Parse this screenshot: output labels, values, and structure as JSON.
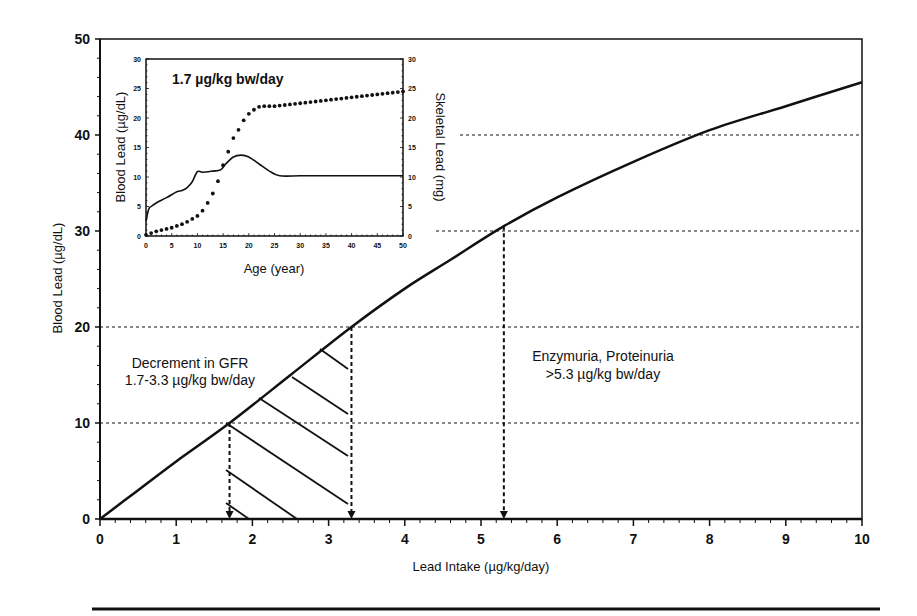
{
  "chart_data": [
    {
      "id": "main",
      "type": "line",
      "title": "",
      "xlabel": "Lead Intake (µg/kg/day)",
      "ylabel": "Blood Lead (µg/dL)",
      "xlim": [
        0,
        10
      ],
      "ylim": [
        0,
        50
      ],
      "xticks": [
        "0",
        "1",
        "2",
        "3",
        "4",
        "5",
        "6",
        "7",
        "8",
        "9",
        "10"
      ],
      "yticks": [
        "0",
        "10",
        "20",
        "30",
        "40",
        "50"
      ],
      "grid": "dashed horizontal reference lines at 10, 20, 30, 40",
      "series": [
        {
          "name": "Blood lead vs lead intake",
          "x": [
            0,
            0.5,
            1,
            1.7,
            2.5,
            3.3,
            4,
            4.6,
            5.3,
            6,
            7,
            8,
            9,
            10
          ],
          "y": [
            0,
            3,
            6,
            10,
            15,
            20,
            24,
            27,
            30.5,
            33.5,
            37.2,
            40.5,
            43,
            45.5
          ]
        }
      ],
      "reference_lines": [
        {
          "type": "vertical-arrow",
          "x": 1.7,
          "from_y": 10,
          "to_y": 0
        },
        {
          "type": "vertical-arrow",
          "x": 3.3,
          "from_y": 20,
          "to_y": 0
        },
        {
          "type": "vertical-arrow",
          "x": 5.3,
          "from_y": 30.5,
          "to_y": 0
        }
      ],
      "hatched_region": {
        "x_range": [
          1.7,
          3.3
        ],
        "description": "Decrement in GFR range"
      },
      "annotations": [
        {
          "lines": [
            "Decrement in GFR",
            "1.7-3.3 µg/kg bw/day"
          ],
          "x": 1.3,
          "y": 16
        },
        {
          "lines": [
            "Enzymuria, Proteinuria",
            ">5.3 µg/kg bw/day"
          ],
          "x": 7,
          "y": 15
        }
      ]
    },
    {
      "id": "inset",
      "type": "line",
      "title": "1.7 µg/kg bw/day",
      "xlabel": "Age (year)",
      "ylabel": "Blood Lead (µg/dL)",
      "y2label": "Skeletal Lead (mg)",
      "xlim": [
        0,
        50
      ],
      "ylim": [
        0,
        30
      ],
      "y2lim": [
        0,
        30
      ],
      "xticks": [
        "0",
        "5",
        "10",
        "15",
        "20",
        "25",
        "30",
        "35",
        "40",
        "45",
        "50"
      ],
      "yticks": [
        "0",
        "5",
        "10",
        "15",
        "20",
        "25",
        "30"
      ],
      "y2ticks": [
        "0",
        "5",
        "10",
        "15",
        "20",
        "25",
        "30"
      ],
      "series": [
        {
          "name": "Blood Lead",
          "style": "solid",
          "axis": "left",
          "x": [
            0,
            0.5,
            1,
            2,
            4,
            6,
            7,
            8,
            9,
            10,
            11,
            13,
            14.5,
            15.5,
            17,
            18.5,
            20,
            22,
            24,
            26,
            30,
            35,
            40,
            45,
            50
          ],
          "y": [
            2.5,
            4.5,
            5,
            5.6,
            6.5,
            7.5,
            7.7,
            8.2,
            9.2,
            10.9,
            10.8,
            11,
            11.2,
            12.2,
            13.4,
            13.7,
            13.4,
            12.2,
            11,
            10.2,
            10.2,
            10.2,
            10.2,
            10.2,
            10.2
          ]
        },
        {
          "name": "Skeletal Lead",
          "style": "dotted",
          "axis": "right",
          "x": [
            0,
            1,
            2,
            3,
            4,
            5,
            6,
            7,
            8,
            9,
            10,
            11,
            12,
            13,
            14,
            15,
            16,
            17,
            18,
            19,
            20,
            21,
            22,
            23,
            24,
            25,
            26,
            27,
            28,
            29,
            30,
            31,
            32,
            33,
            34,
            35,
            36,
            37,
            38,
            39,
            40,
            41,
            42,
            43,
            44,
            45,
            46,
            47,
            48,
            49,
            50
          ],
          "y": [
            0.2,
            0.5,
            0.8,
            1.0,
            1.2,
            1.4,
            1.7,
            2.0,
            2.4,
            2.9,
            3.4,
            4.3,
            5.6,
            7.2,
            9.3,
            12.0,
            14.3,
            16.6,
            18.0,
            19.6,
            20.7,
            21.4,
            21.9,
            22.0,
            22.0,
            22.0,
            22.1,
            22.2,
            22.3,
            22.4,
            22.5,
            22.6,
            22.7,
            22.8,
            22.9,
            23.0,
            23.1,
            23.2,
            23.3,
            23.4,
            23.5,
            23.6,
            23.7,
            23.8,
            23.9,
            24.0,
            24.1,
            24.2,
            24.3,
            24.4,
            24.5
          ]
        }
      ]
    }
  ],
  "main": {
    "xlabel": "Lead Intake (µg/kg/day)",
    "ylabel": "Blood Lead (µg/dL)",
    "annot_gfr_line1": "Decrement in GFR",
    "annot_gfr_line2": "1.7-3.3 µg/kg bw/day",
    "annot_enz_line1": "Enzymuria, Proteinuria",
    "annot_enz_line2": ">5.3 µg/kg bw/day"
  },
  "inset": {
    "title": "1.7 µg/kg bw/day",
    "xlabel": "Age (year)",
    "ylabel": "Blood Lead (µg/dL)",
    "y2label": "Skeletal Lead (mg)"
  },
  "colors": {
    "ink": "#111111",
    "background": "#ffffff"
  }
}
